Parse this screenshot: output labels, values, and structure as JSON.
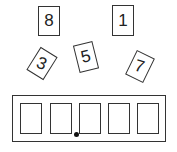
{
  "cards": [
    {
      "label": "8",
      "x": 38,
      "y": 6,
      "rotate": 0
    },
    {
      "label": "1",
      "x": 112,
      "y": 6,
      "rotate": 0
    },
    {
      "label": "3",
      "x": 33,
      "y": 50,
      "rotate": 30
    },
    {
      "label": "5",
      "x": 75,
      "y": 44,
      "rotate": -15
    },
    {
      "label": "7",
      "x": 130,
      "y": 54,
      "rotate": 25
    }
  ],
  "tray": {
    "slots": [
      "",
      "",
      "",
      "",
      ""
    ],
    "marker_after_slot": 2
  },
  "colors": {
    "stroke": "#333333",
    "background": "#ffffff"
  }
}
